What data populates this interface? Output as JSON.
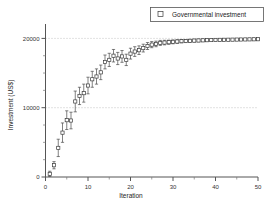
{
  "chart_data": {
    "type": "scatter",
    "title": "",
    "xlabel": "Iteration",
    "ylabel": "Investment (US$)",
    "xlim": [
      0,
      50
    ],
    "ylim": [
      0,
      21500
    ],
    "grid": true,
    "gridlines_y": [
      10000,
      20000
    ],
    "legend_position": "top-right",
    "marker": "open-square",
    "errorbars": true,
    "xticks": [
      0,
      10,
      20,
      30,
      40,
      50
    ],
    "xticklabels": [
      "0",
      "10",
      "20",
      "30",
      "40",
      "50"
    ],
    "yticks": [
      0,
      10000,
      20000
    ],
    "yticklabels": [
      "0",
      "10000",
      "20000"
    ],
    "series": [
      {
        "name": "Governmental investment",
        "x": [
          1,
          2,
          3,
          4,
          5,
          6,
          7,
          8,
          9,
          10,
          11,
          12,
          13,
          14,
          15,
          16,
          17,
          18,
          19,
          20,
          21,
          22,
          23,
          24,
          25,
          26,
          27,
          28,
          29,
          30,
          31,
          32,
          33,
          34,
          35,
          36,
          37,
          38,
          39,
          40,
          41,
          42,
          43,
          44,
          45,
          46,
          47,
          48,
          49,
          50
        ],
        "values": [
          450,
          1700,
          4200,
          6400,
          8200,
          8150,
          10900,
          11700,
          12100,
          13200,
          14100,
          14500,
          15100,
          16600,
          16900,
          17500,
          17100,
          17400,
          16900,
          17800,
          18100,
          18300,
          18600,
          18900,
          19100,
          19200,
          19350,
          19400,
          19450,
          19500,
          19550,
          19600,
          19620,
          19650,
          19680,
          19700,
          19720,
          19740,
          19760,
          19780,
          19790,
          19800,
          19810,
          19820,
          19830,
          19840,
          19850,
          19860,
          19870,
          19880
        ],
        "errors": [
          380,
          520,
          1250,
          1400,
          1350,
          1200,
          1500,
          1250,
          1300,
          1200,
          1150,
          1100,
          1050,
          1000,
          950,
          900,
          880,
          850,
          820,
          780,
          700,
          620,
          560,
          500,
          440,
          400,
          360,
          330,
          300,
          280,
          260,
          240,
          220,
          210,
          200,
          190,
          180,
          170,
          165,
          160,
          155,
          150,
          145,
          140,
          138,
          135,
          132,
          130,
          128,
          125
        ]
      }
    ]
  },
  "legend": {
    "entries": [
      {
        "label": "Governmental investment",
        "marker": "open-square"
      }
    ]
  },
  "axes": {
    "x_title": "Iteration",
    "y_title": "Investment (US$)"
  }
}
